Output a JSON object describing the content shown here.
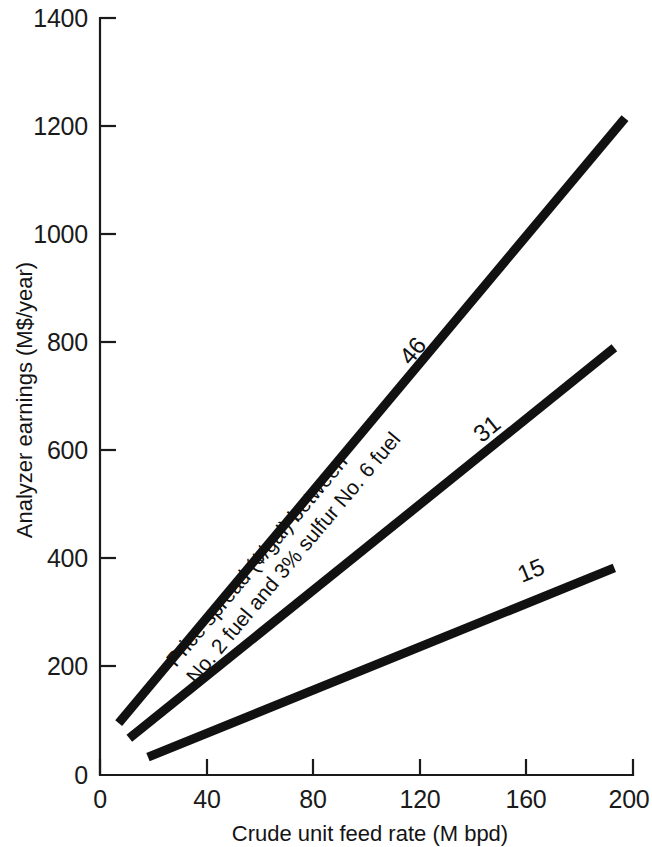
{
  "chart_data": {
    "type": "line",
    "title": "",
    "xlabel": "Crude unit feed rate  (M bpd)",
    "ylabel": "Analyzer earnings (M$/year)",
    "xlim": [
      0,
      200
    ],
    "ylim": [
      0,
      1400
    ],
    "xticks": [
      0,
      40,
      80,
      120,
      160,
      200
    ],
    "yticks": [
      0,
      200,
      400,
      600,
      800,
      1000,
      1200,
      1400
    ],
    "xtick_labels": [
      "0",
      "40",
      "80",
      "120",
      "160",
      "200"
    ],
    "ytick_labels": [
      "0",
      "200",
      "400",
      "600",
      "800",
      "1000",
      "1200",
      "1400"
    ],
    "grid": false,
    "legend": "inline-end-labels",
    "annotation": {
      "line1": "Price spread (¢/gal) between",
      "line2": "No. 2 fuel and 3% sulfur No. 6 fuel"
    },
    "series": [
      {
        "name": "46",
        "label": "46",
        "x": [
          7,
          197
        ],
        "values": [
          96,
          1215
        ]
      },
      {
        "name": "31",
        "label": "31",
        "x": [
          11,
          193
        ],
        "values": [
          68,
          790
        ]
      },
      {
        "name": "15",
        "label": "15",
        "x": [
          18,
          193
        ],
        "values": [
          33,
          383
        ]
      }
    ]
  },
  "axes": {
    "y_title": "Analyzer earnings (M$/year)",
    "x_title": "Crude unit feed rate  (M bpd)",
    "y_labels": {
      "t1400": "1400",
      "t1200": "1200",
      "t1000": "1000",
      "t800": "800",
      "t600": "600",
      "t400": "400",
      "t200": "200",
      "t0": "0"
    },
    "x_labels": {
      "t0": "0",
      "t40": "40",
      "t80": "80",
      "t120": "120",
      "t160": "160",
      "t200": "200"
    }
  },
  "series_labels": {
    "high": "46",
    "mid": "31",
    "low": "15"
  },
  "annotation": {
    "line1": "Price spread (¢/gal) between",
    "line2": "No. 2 fuel and 3% sulfur No. 6 fuel"
  },
  "colors": {
    "ink": "#111111",
    "axis": "#1a1a1a",
    "background": "#ffffff"
  }
}
